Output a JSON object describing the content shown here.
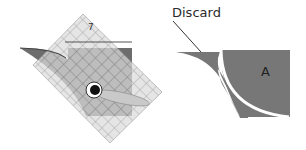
{
  "figure": {
    "left_panel": {
      "description": "Ruler with circle cutter template laid diagonally over a dark square fabric piece with curved edge",
      "ruler_mark": "7",
      "colors": {
        "fabric": "#6e6e6e",
        "ruler_grid": "#d8d8d8",
        "ruler_lines": "#555555",
        "cutter_handle": "#c8c8c8"
      }
    },
    "right_panel": {
      "callout_label": "Discard",
      "piece_label": "A",
      "colors": {
        "fabric": "#777777",
        "cut_line": "#ffffff"
      }
    }
  }
}
